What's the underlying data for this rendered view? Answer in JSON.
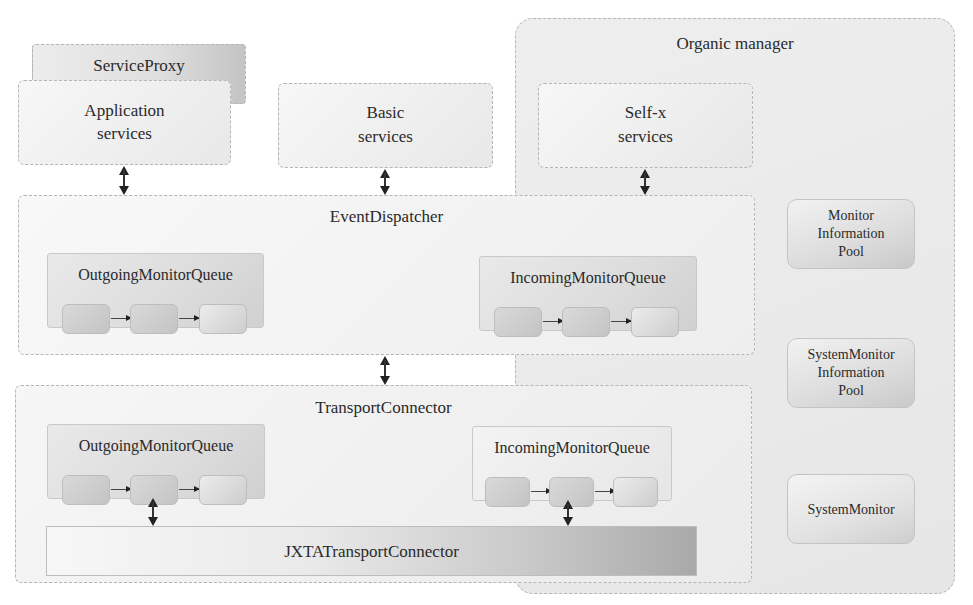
{
  "organic_manager": {
    "title": "Organic manager"
  },
  "service_proxy": {
    "label": "ServiceProxy"
  },
  "application_services": {
    "line1": "Application",
    "line2": "services"
  },
  "basic_services": {
    "line1": "Basic",
    "line2": "services"
  },
  "selfx_services": {
    "line1": "Self-x",
    "line2": "services"
  },
  "event_dispatcher": {
    "title": "EventDispatcher",
    "outgoing_queue": {
      "label": "OutgoingMonitorQueue",
      "cells": 3
    },
    "incoming_queue": {
      "label": "IncomingMonitorQueue",
      "cells": 3
    }
  },
  "transport_connector": {
    "title": "TransportConnector",
    "outgoing_queue": {
      "label": "OutgoingMonitorQueue",
      "cells": 3
    },
    "incoming_queue": {
      "label": "IncomingMonitorQueue",
      "cells": 3
    },
    "jxta": {
      "label": "JXTATransportConnector"
    }
  },
  "right_panel": {
    "monitor_info_pool": {
      "line1": "Monitor",
      "line2": "Information",
      "line3": "Pool"
    },
    "system_monitor_info_pool": {
      "line1": "SystemMonitor",
      "line2": "Information",
      "line3": "Pool"
    },
    "system_monitor": {
      "label": "SystemMonitor"
    }
  },
  "connections": [
    {
      "from": "Application services",
      "to": "EventDispatcher",
      "type": "bidirectional"
    },
    {
      "from": "Basic services",
      "to": "EventDispatcher",
      "type": "bidirectional"
    },
    {
      "from": "Self-x services",
      "to": "EventDispatcher",
      "type": "bidirectional"
    },
    {
      "from": "EventDispatcher",
      "to": "TransportConnector",
      "type": "bidirectional"
    },
    {
      "from": "OutgoingMonitorQueue",
      "to": "JXTATransportConnector",
      "type": "bidirectional"
    },
    {
      "from": "IncomingMonitorQueue",
      "to": "JXTATransportConnector",
      "type": "bidirectional"
    }
  ]
}
